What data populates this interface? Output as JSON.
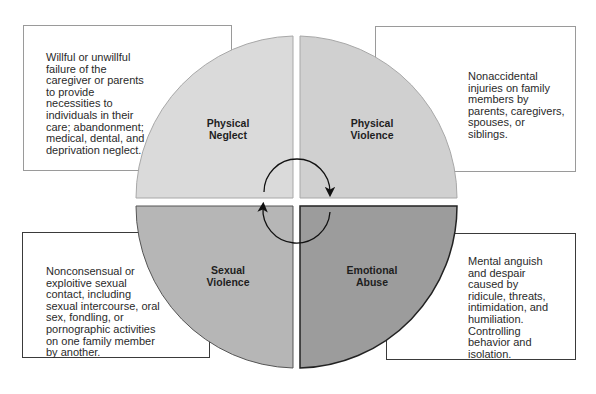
{
  "diagram": {
    "cycle_arrows": "clockwise",
    "quadrants": [
      {
        "id": "physical-neglect",
        "label_line1": "Physical",
        "label_line2": "Neglect",
        "position": "top-left",
        "color": "#d9d9d9",
        "description": "Willful or unwillful failure of the caregiver or parents to provide necessities to individuals in their care; abandonment; medical, dental, and deprivation neglect."
      },
      {
        "id": "physical-violence",
        "label_line1": "Physical",
        "label_line2": "Violence",
        "position": "top-right",
        "color": "#cfcfcf",
        "description": "Nonaccidental injuries on family members by parents, caregivers, spouses, or siblings."
      },
      {
        "id": "sexual-violence",
        "label_line1": "Sexual",
        "label_line2": "Violence",
        "position": "bottom-left",
        "color": "#b4b4b4",
        "description": "Nonconsensual or exploitive sexual contact, including sexual intercourse, oral sex, fondling, or pornographic activities on one family member by another."
      },
      {
        "id": "emotional-abuse",
        "label_line1": "Emotional",
        "label_line2": "Abuse",
        "position": "bottom-right",
        "color": "#9a9a9a",
        "description": "Mental anguish and despair caused by ridicule, threats, intimidation, and humiliation. Controlling behavior and isolation."
      }
    ]
  }
}
